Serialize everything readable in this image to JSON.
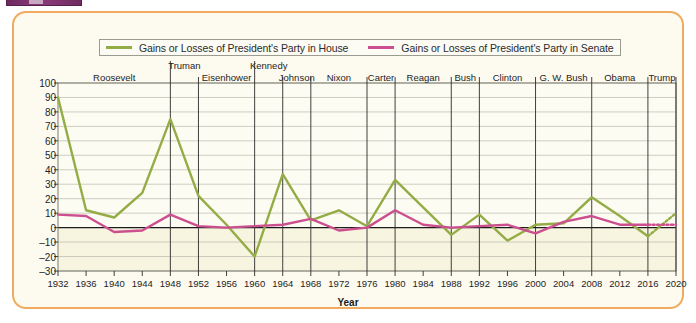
{
  "chapter_tab": {
    "present": true,
    "color": "#7c3369"
  },
  "frame": {
    "border_color": "#f0ab5f",
    "background": "#fdfaf0"
  },
  "legend": {
    "position": "top",
    "items": [
      {
        "label": "Gains or Losses of President's Party in House",
        "color": "#93ac45",
        "icon": "line-swatch"
      },
      {
        "label": "Gains or Losses of President's Party in Senate",
        "color": "#cc4f8f",
        "icon": "line-swatch"
      }
    ]
  },
  "presidents": [
    {
      "name": "Roosevelt",
      "start": 1932,
      "end": 1948
    },
    {
      "name": "Truman",
      "start": 1948,
      "end": 1952
    },
    {
      "name": "Eisenhower",
      "start": 1952,
      "end": 1960
    },
    {
      "name": "Kennedy",
      "start": 1960,
      "end": 1964
    },
    {
      "name": "Johnson",
      "start": 1964,
      "end": 1968
    },
    {
      "name": "Nixon",
      "start": 1968,
      "end": 1976
    },
    {
      "name": "Carter",
      "start": 1976,
      "end": 1980
    },
    {
      "name": "Reagan",
      "start": 1980,
      "end": 1988
    },
    {
      "name": "Bush",
      "start": 1988,
      "end": 1992
    },
    {
      "name": "Clinton",
      "start": 1992,
      "end": 2000
    },
    {
      "name": "G. W. Bush",
      "start": 2000,
      "end": 2008
    },
    {
      "name": "Obama",
      "start": 2008,
      "end": 2016
    },
    {
      "name": "Trump",
      "start": 2016,
      "end": 2020
    }
  ],
  "chart_data": {
    "type": "line",
    "title": "",
    "xlabel": "Year",
    "ylabel": "",
    "xlim": [
      1932,
      2020
    ],
    "ylim": [
      -30,
      100
    ],
    "ytick_step": 10,
    "grid": true,
    "legend_position": "top",
    "zero_line": true,
    "x": [
      1932,
      1936,
      1940,
      1944,
      1948,
      1952,
      1956,
      1960,
      1964,
      1968,
      1972,
      1976,
      1980,
      1984,
      1988,
      1992,
      1996,
      2000,
      2004,
      2008,
      2012,
      2016,
      2020
    ],
    "xtick_labels": [
      "1932",
      "1936",
      "1940",
      "1944",
      "1948",
      "1952",
      "1956",
      "1960",
      "1964",
      "1968",
      "1972",
      "1976",
      "1980",
      "1984",
      "1988",
      "1992",
      "1996",
      "2000",
      "2004",
      "2008",
      "2012",
      "2016",
      "2020"
    ],
    "ytick_labels": [
      "100",
      "90",
      "80",
      "70",
      "60",
      "50",
      "40",
      "30",
      "20",
      "10",
      "0",
      "-10",
      "-20",
      "-30"
    ],
    "series": [
      {
        "name": "Gains or Losses of President's Party in House",
        "color": "#93ac45",
        "projected_from": 2016,
        "values": [
          90,
          12,
          7,
          24,
          75,
          22,
          2,
          -20,
          37,
          5,
          12,
          1,
          33,
          14,
          -5,
          9,
          -9,
          2,
          3,
          21,
          8,
          -6,
          10
        ]
      },
      {
        "name": "Gains or Losses of President's Party in Senate",
        "color": "#cc4f8f",
        "projected_from": 2016,
        "values": [
          9,
          8,
          -3,
          -2,
          9,
          1,
          0,
          1,
          2,
          6,
          -2,
          0,
          12,
          2,
          0,
          1,
          2,
          -4,
          4,
          8,
          2,
          2,
          2
        ]
      }
    ]
  }
}
